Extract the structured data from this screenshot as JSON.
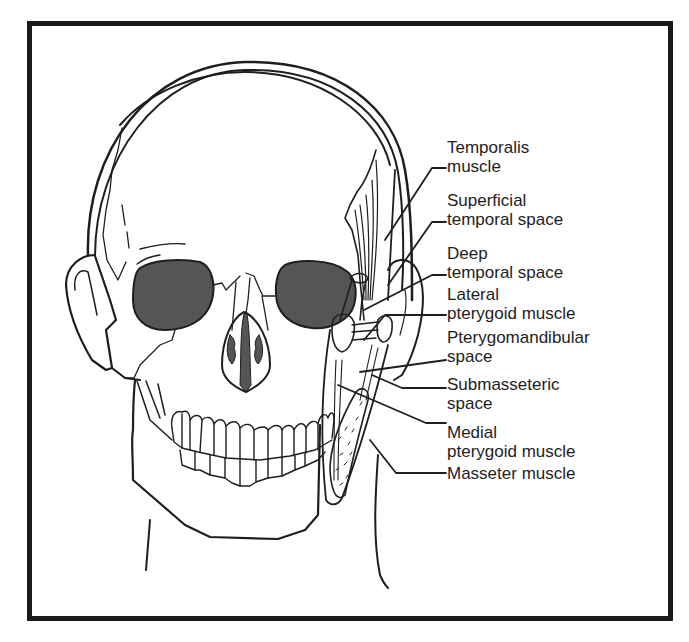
{
  "figure": {
    "colors": {
      "ink": "#1e1e1e",
      "orbit_fill": "#555555",
      "frame": "#1a1a1a",
      "background": "#ffffff"
    }
  },
  "labels": [
    {
      "id": "temporalis",
      "line1": "Temporalis",
      "line2": "muscle",
      "top": 138
    },
    {
      "id": "superficial-temporal",
      "line1": "Superficial",
      "line2": "temporal space",
      "top": 191
    },
    {
      "id": "deep-temporal",
      "line1": "Deep",
      "line2": "temporal space",
      "top": 244
    },
    {
      "id": "lateral-pterygoid",
      "line1": "Lateral",
      "line2": "pterygoid muscle",
      "top": 285
    },
    {
      "id": "pterygomandibular",
      "line1": "Pterygomandibular",
      "line2": "space",
      "top": 328
    },
    {
      "id": "submasseteric",
      "line1": "Submasseteric",
      "line2": "space",
      "top": 375
    },
    {
      "id": "medial-pterygoid",
      "line1": "Medial",
      "line2": "pterygoid muscle",
      "top": 423
    },
    {
      "id": "masseter",
      "line1": "Masseter muscle",
      "line2": "",
      "top": 470
    }
  ]
}
